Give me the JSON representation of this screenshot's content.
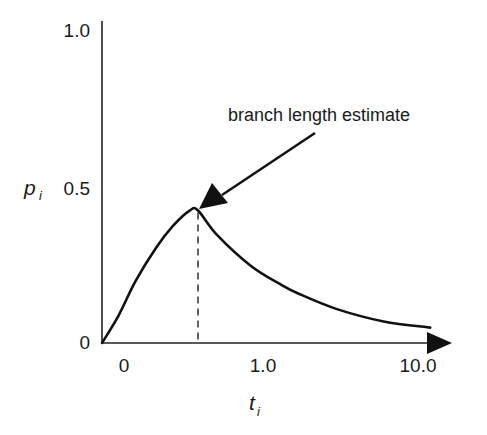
{
  "chart_data": {
    "type": "line",
    "title": "",
    "xlabel": "t",
    "xlabel_subscript": "i",
    "ylabel": "p",
    "ylabel_subscript": "i",
    "x_scale": "log-like (0, 1.0, 10.0 ticks)",
    "x_ticks": [
      "0",
      "1.0",
      "10.0"
    ],
    "y_ticks": [
      "0",
      "0.5",
      "1.0"
    ],
    "ylim": [
      0,
      1.0
    ],
    "grid": false,
    "series": [
      {
        "name": "p_i vs t_i",
        "points": [
          {
            "x": 0.0,
            "y": 0.0
          },
          {
            "x": 0.08,
            "y": 0.09
          },
          {
            "x": 0.16,
            "y": 0.2
          },
          {
            "x": 0.26,
            "y": 0.31
          },
          {
            "x": 0.34,
            "y": 0.38
          },
          {
            "x": 0.42,
            "y": 0.43
          },
          {
            "x": 0.46,
            "y": 0.43
          },
          {
            "x": 0.62,
            "y": 0.35
          },
          {
            "x": 0.9,
            "y": 0.25
          },
          {
            "x": 1.3,
            "y": 0.19
          },
          {
            "x": 1.7,
            "y": 0.16
          },
          {
            "x": 3.0,
            "y": 0.11
          },
          {
            "x": 6.0,
            "y": 0.07
          },
          {
            "x": 12.0,
            "y": 0.05
          }
        ]
      }
    ],
    "peak": {
      "x": 0.46,
      "y": 0.43
    },
    "annotations": [
      {
        "text": "branch length estimate",
        "points_to": "peak",
        "style": "arrow",
        "marker": "dashed vertical line from peak to x-axis"
      }
    ]
  }
}
